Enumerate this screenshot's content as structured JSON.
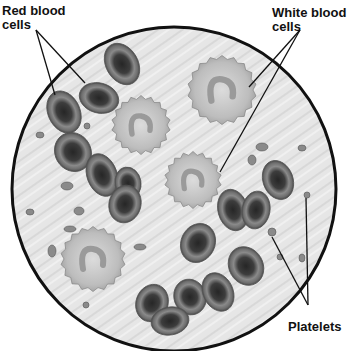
{
  "diagram": {
    "labels": {
      "red_blood_cells": [
        "Red blood",
        "cells"
      ],
      "white_blood_cells": [
        "White blood",
        "cells"
      ],
      "platelets": "Platelets"
    },
    "colors": {
      "background": "#ffffff",
      "field": "#e4e4e4",
      "outline": "#111111",
      "rbc_rim": "#7a7a7a",
      "rbc_center": "#2e2e2e",
      "wbc": "#c9c9c9",
      "nucleus": "#9a9a9a",
      "platelet": "#8a8a8a"
    },
    "field": {
      "cx": 174,
      "cy": 189,
      "r": 162
    },
    "red_blood_cells": [
      {
        "cx": 122,
        "cy": 64,
        "rx": 16,
        "ry": 22,
        "rot": -30
      },
      {
        "cx": 99,
        "cy": 98,
        "rx": 20,
        "ry": 15,
        "rot": 15
      },
      {
        "cx": 64,
        "cy": 112,
        "rx": 16,
        "ry": 22,
        "rot": -25
      },
      {
        "cx": 73,
        "cy": 152,
        "rx": 18,
        "ry": 20,
        "rot": -30
      },
      {
        "cx": 102,
        "cy": 175,
        "rx": 15,
        "ry": 22,
        "rot": -20
      },
      {
        "cx": 128,
        "cy": 183,
        "rx": 13,
        "ry": 16,
        "rot": -10
      },
      {
        "cx": 125,
        "cy": 204,
        "rx": 16,
        "ry": 19,
        "rot": 15
      },
      {
        "cx": 198,
        "cy": 243,
        "rx": 17,
        "ry": 20,
        "rot": 25
      },
      {
        "cx": 233,
        "cy": 210,
        "rx": 15,
        "ry": 21,
        "rot": -15
      },
      {
        "cx": 256,
        "cy": 210,
        "rx": 14,
        "ry": 19,
        "rot": 10
      },
      {
        "cx": 278,
        "cy": 180,
        "rx": 15,
        "ry": 20,
        "rot": -20
      },
      {
        "cx": 246,
        "cy": 266,
        "rx": 17,
        "ry": 20,
        "rot": -30
      },
      {
        "cx": 152,
        "cy": 303,
        "rx": 16,
        "ry": 19,
        "rot": 20
      },
      {
        "cx": 190,
        "cy": 297,
        "rx": 16,
        "ry": 18,
        "rot": -20
      },
      {
        "cx": 218,
        "cy": 292,
        "rx": 15,
        "ry": 20,
        "rot": -25
      },
      {
        "cx": 170,
        "cy": 321,
        "rx": 19,
        "ry": 14,
        "rot": -10
      }
    ],
    "white_blood_cells": [
      {
        "cx": 141,
        "cy": 125,
        "r": 27
      },
      {
        "cx": 222,
        "cy": 90,
        "r": 32
      },
      {
        "cx": 193,
        "cy": 180,
        "r": 26
      },
      {
        "cx": 93,
        "cy": 259,
        "r": 30
      }
    ],
    "platelets": [
      {
        "cx": 40,
        "cy": 135,
        "rx": 4,
        "ry": 3
      },
      {
        "cx": 87,
        "cy": 126,
        "rx": 3,
        "ry": 3
      },
      {
        "cx": 67,
        "cy": 186,
        "rx": 6,
        "ry": 4
      },
      {
        "cx": 79,
        "cy": 211,
        "rx": 5,
        "ry": 4
      },
      {
        "cx": 30,
        "cy": 212,
        "rx": 4,
        "ry": 3
      },
      {
        "cx": 70,
        "cy": 229,
        "rx": 6,
        "ry": 3
      },
      {
        "cx": 52,
        "cy": 251,
        "rx": 4,
        "ry": 6
      },
      {
        "cx": 140,
        "cy": 247,
        "rx": 6,
        "ry": 3
      },
      {
        "cx": 86,
        "cy": 305,
        "rx": 3,
        "ry": 3
      },
      {
        "cx": 262,
        "cy": 147,
        "rx": 6,
        "ry": 4
      },
      {
        "cx": 252,
        "cy": 160,
        "rx": 4,
        "ry": 5
      },
      {
        "cx": 302,
        "cy": 148,
        "rx": 4,
        "ry": 3
      },
      {
        "cx": 307,
        "cy": 195,
        "rx": 3,
        "ry": 3
      },
      {
        "cx": 272,
        "cy": 232,
        "rx": 4,
        "ry": 4
      },
      {
        "cx": 280,
        "cy": 257,
        "rx": 3,
        "ry": 3
      },
      {
        "cx": 302,
        "cy": 258,
        "rx": 3,
        "ry": 4
      }
    ],
    "leader_lines": {
      "red": [
        [
          36,
          30,
          55,
          95
        ],
        [
          36,
          30,
          85,
          83
        ]
      ],
      "white": [
        [
          300,
          30,
          249,
          87
        ],
        [
          300,
          30,
          220,
          172
        ]
      ],
      "platelets": [
        [
          308,
          305,
          272,
          237
        ],
        [
          308,
          305,
          306,
          198
        ]
      ]
    }
  }
}
